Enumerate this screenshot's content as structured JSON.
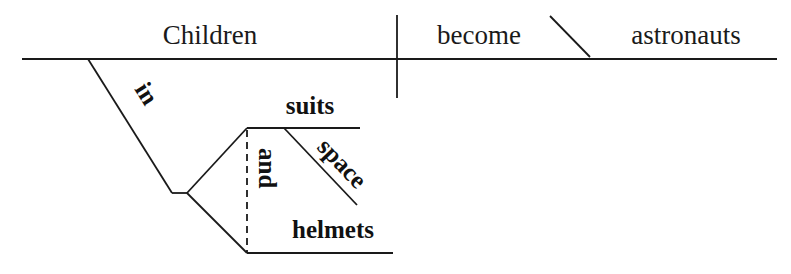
{
  "diagram": {
    "type": "Reed-Kellogg sentence diagram",
    "sentence_words": {
      "subject": "Children",
      "verb": "become",
      "predicate_nominative": "astronauts",
      "preposition": "in",
      "conjunction": "and",
      "object_1": "suits",
      "modifier": "space",
      "object_2": "helmets"
    },
    "colors": {
      "line": "#1a1a1a",
      "text": "#1a1a1a",
      "background": "#ffffff"
    }
  }
}
